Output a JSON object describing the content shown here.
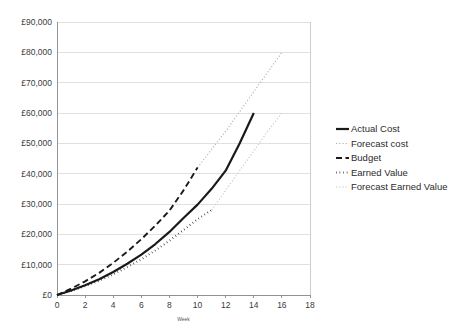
{
  "chart_data": {
    "type": "line",
    "title": "",
    "xlabel": "Week",
    "ylabel": "",
    "xlim": [
      0,
      18
    ],
    "ylim": [
      0,
      90000
    ],
    "grid": true,
    "legend_position": "right",
    "x_ticks": [
      0,
      2,
      4,
      6,
      8,
      10,
      12,
      14,
      16,
      18
    ],
    "x_tick_labels": [
      "0",
      "2",
      "4",
      "6",
      "8",
      "10",
      "12",
      "14",
      "16",
      "18"
    ],
    "y_ticks": [
      0,
      10000,
      20000,
      30000,
      40000,
      50000,
      60000,
      70000,
      80000,
      90000
    ],
    "y_tick_labels": [
      "£0",
      "£10,000",
      "£20,000",
      "£30,000",
      "£40,000",
      "£50,000",
      "£60,000",
      "£70,000",
      "£80,000",
      "£90,000"
    ],
    "series": [
      {
        "name": "Actual Cost",
        "style": "solid-thick",
        "color": "#1a1a1a",
        "width": 2.2,
        "dash": "",
        "x": [
          0,
          1,
          2,
          3,
          4,
          5,
          6,
          7,
          8,
          9,
          10,
          11,
          12,
          13,
          14
        ],
        "values": [
          0,
          1500,
          3200,
          5200,
          7600,
          10300,
          13300,
          16800,
          20800,
          25400,
          29800,
          35000,
          41000,
          50000,
          60000
        ]
      },
      {
        "name": "Forecast cost",
        "style": "dotted-light",
        "color": "#b0b0b0",
        "width": 1.1,
        "dash": "1.2,2.0",
        "x": [
          10,
          11,
          12,
          13,
          14,
          15,
          16
        ],
        "values": [
          42000,
          48000,
          54000,
          60500,
          67000,
          73500,
          80000
        ]
      },
      {
        "name": "Budget",
        "style": "dashed-dark",
        "color": "#1a1a1a",
        "width": 1.9,
        "dash": "6,3.5",
        "x": [
          0,
          1,
          2,
          3,
          4,
          5,
          6,
          7,
          8,
          9,
          10
        ],
        "values": [
          0,
          2100,
          4500,
          7300,
          10600,
          14300,
          18400,
          22900,
          27800,
          34500,
          42000
        ]
      },
      {
        "name": "Earned Value",
        "style": "dotted-dark",
        "color": "#1a1a1a",
        "width": 2.0,
        "dash": "0.6,3.0",
        "x": [
          0,
          1,
          2,
          3,
          4,
          5,
          6,
          7,
          8,
          9,
          10,
          11
        ],
        "values": [
          0,
          1300,
          2900,
          4700,
          6800,
          9200,
          11800,
          14700,
          17900,
          21400,
          25000,
          28000
        ]
      },
      {
        "name": "Forecast Earned Value",
        "style": "dotted-verylight",
        "color": "#c6c6c6",
        "width": 1.1,
        "dash": "1.2,2.0",
        "x": [
          11,
          12,
          13,
          14,
          15,
          16
        ],
        "values": [
          28000,
          34500,
          41000,
          47500,
          54000,
          60000
        ]
      }
    ]
  },
  "legend": {
    "items": [
      {
        "label": "Actual Cost",
        "marker": "solid-thick-line",
        "color": "#1a1a1a"
      },
      {
        "label": "Forecast cost",
        "marker": "dotted-light-line",
        "color": "#b0b0b0"
      },
      {
        "label": "Budget",
        "marker": "solid-line",
        "color": "#1a1a1a"
      },
      {
        "label": "Earned Value",
        "marker": "dashed-dark-line",
        "color": "#1a1a1a"
      },
      {
        "label": "Forecast Earned Value",
        "marker": "light-line",
        "color": "#c6c6c6"
      }
    ]
  }
}
